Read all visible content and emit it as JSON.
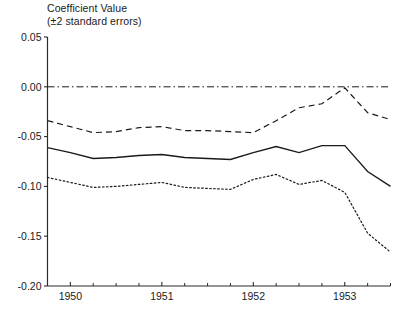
{
  "chart_data": {
    "type": "line",
    "title": "Coefficient Value (±2 standard errors)",
    "title_line1": "Coefficient Value",
    "title_line2": "(±2 standard errors)",
    "xlabel": "",
    "ylabel": "Coefficient Value",
    "ylim": [
      -0.2,
      0.05
    ],
    "xlim": [
      1949.75,
      1953.5
    ],
    "grid": false,
    "legend": "none",
    "ytick_labels": [
      "0.05",
      "0.00",
      "-0.05",
      "-0.10",
      "-0.15",
      "-0.20"
    ],
    "yticks": [
      0.05,
      0.0,
      -0.05,
      -0.1,
      -0.15,
      -0.2
    ],
    "xtick_labels": [
      "1950",
      "1951",
      "1952",
      "1953"
    ],
    "xticks": [
      1950,
      1951,
      1952,
      1953
    ],
    "x": [
      1949.75,
      1950.0,
      1950.25,
      1950.5,
      1950.75,
      1951.0,
      1951.25,
      1951.5,
      1951.75,
      1952.0,
      1952.25,
      1952.5,
      1952.75,
      1953.0,
      1953.25,
      1953.5
    ],
    "annotations": [
      {
        "label": "zero reference line",
        "value": 0.0,
        "style": "dash-dot"
      }
    ],
    "series": [
      {
        "name": "Upper bound (+2 SE)",
        "style": "dashed",
        "values": [
          -0.034,
          -0.04,
          -0.046,
          -0.045,
          -0.041,
          -0.04,
          -0.044,
          -0.044,
          -0.045,
          -0.046,
          -0.034,
          -0.021,
          -0.017,
          -0.001,
          -0.026,
          -0.033
        ]
      },
      {
        "name": "Coefficient estimate",
        "style": "solid",
        "values": [
          -0.061,
          -0.066,
          -0.072,
          -0.071,
          -0.069,
          -0.068,
          -0.071,
          -0.072,
          -0.073,
          -0.066,
          -0.06,
          -0.066,
          -0.059,
          -0.059,
          -0.085,
          -0.1
        ]
      },
      {
        "name": "Lower bound (-2 SE)",
        "style": "dotted",
        "values": [
          -0.091,
          -0.096,
          -0.101,
          -0.1,
          -0.098,
          -0.096,
          -0.101,
          -0.102,
          -0.103,
          -0.093,
          -0.088,
          -0.098,
          -0.094,
          -0.106,
          -0.147,
          -0.166
        ]
      }
    ]
  }
}
